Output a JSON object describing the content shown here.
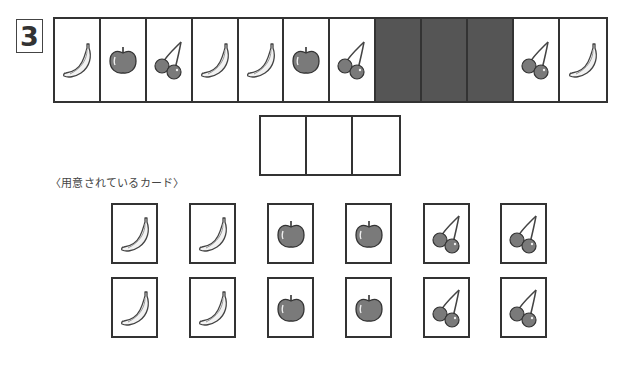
{
  "question_number": "3",
  "sequence": [
    {
      "fruit": "banana",
      "hidden": false
    },
    {
      "fruit": "apple",
      "hidden": false
    },
    {
      "fruit": "cherry",
      "hidden": false
    },
    {
      "fruit": "banana",
      "hidden": false
    },
    {
      "fruit": "banana",
      "hidden": false
    },
    {
      "fruit": "apple",
      "hidden": false
    },
    {
      "fruit": "cherry",
      "hidden": false
    },
    {
      "fruit": null,
      "hidden": true
    },
    {
      "fruit": null,
      "hidden": true
    },
    {
      "fruit": null,
      "hidden": true
    },
    {
      "fruit": "cherry",
      "hidden": false
    },
    {
      "fruit": "banana",
      "hidden": false
    }
  ],
  "answer_slots": 3,
  "prepared_cards_label": "〈用意されているカード〉",
  "prepared_cards": [
    [
      "banana",
      "banana",
      "apple",
      "apple",
      "cherry",
      "cherry"
    ],
    [
      "banana",
      "banana",
      "apple",
      "apple",
      "cherry",
      "cherry"
    ]
  ],
  "colors": {
    "border": "#333333",
    "hidden_cell": "#555555",
    "fruit_fill": "#7a7a7a",
    "banana_fill": "#f2f2f2"
  }
}
